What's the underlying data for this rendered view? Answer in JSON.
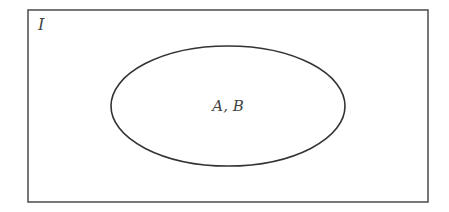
{
  "diagram": {
    "type": "venn",
    "universe": {
      "label": "I"
    },
    "sets": [
      {
        "label": "A, B",
        "note": "A and B coincide (same ellipse)"
      }
    ],
    "colors": {
      "stroke": "#333333",
      "text": "#444444",
      "background": "#ffffff"
    }
  }
}
